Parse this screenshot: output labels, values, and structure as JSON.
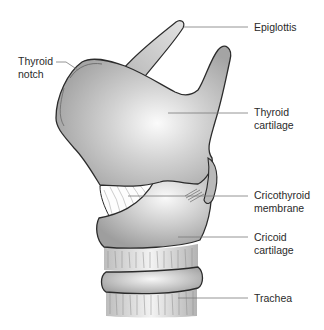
{
  "figure": {
    "colors": {
      "outline": "#2b2b2b",
      "fill_light": "#f4f4f4",
      "fill_dark": "#a9a9a9",
      "leader_line": "#7a7a7a",
      "label_text": "#2a2a2a",
      "background": "#ffffff"
    }
  },
  "labels": [
    {
      "id": "epiglottis",
      "lines": [
        "Epiglottis"
      ]
    },
    {
      "id": "thyroid-notch",
      "lines": [
        "Thyroid",
        "notch"
      ]
    },
    {
      "id": "thyroid-cartilage",
      "lines": [
        "Thyroid",
        "cartilage"
      ]
    },
    {
      "id": "cricothyroid-membrane",
      "lines": [
        "Cricothyroid",
        "membrane"
      ]
    },
    {
      "id": "cricoid-cartilage",
      "lines": [
        "Cricoid",
        "cartilage"
      ]
    },
    {
      "id": "trachea",
      "lines": [
        "Trachea"
      ]
    }
  ]
}
